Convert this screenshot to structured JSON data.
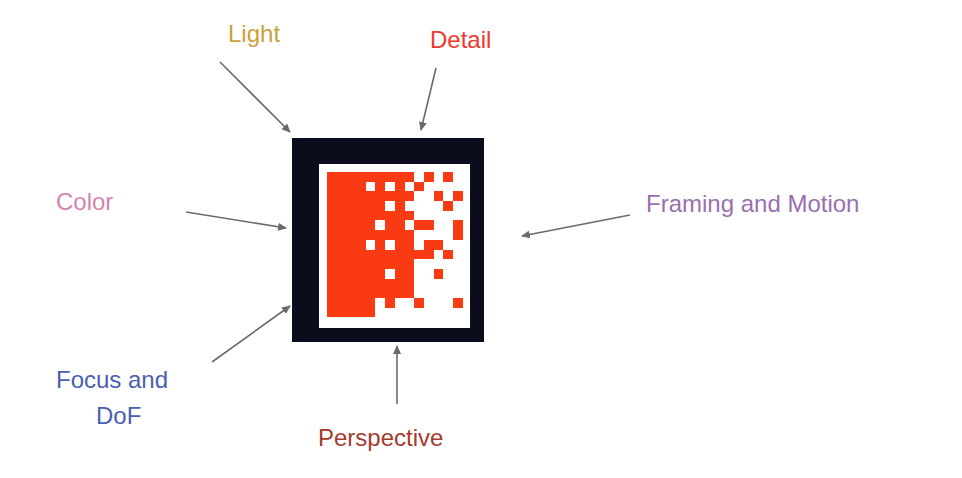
{
  "diagram": {
    "labels": [
      {
        "id": "light",
        "text": "Light",
        "color": "#c9a23a",
        "x": 228,
        "y": 20
      },
      {
        "id": "detail",
        "text": "Detail",
        "color": "#ee3a2e",
        "x": 430,
        "y": 26
      },
      {
        "id": "color",
        "text": "Color",
        "color": "#d584b0",
        "x": 56,
        "y": 188
      },
      {
        "id": "framing",
        "text": "Framing and Motion",
        "color": "#9a6fb0",
        "x": 646,
        "y": 190
      },
      {
        "id": "focus-line1",
        "text": "Focus and",
        "color": "#4a5fb0",
        "x": 56,
        "y": 366
      },
      {
        "id": "focus-line2",
        "text": "DoF",
        "color": "#4a5fb0",
        "x": 96,
        "y": 402
      },
      {
        "id": "perspective",
        "text": "Perspective",
        "color": "#a53a2e",
        "x": 318,
        "y": 424
      }
    ],
    "arrows": [
      {
        "id": "light-arrow",
        "from": [
          220,
          62
        ],
        "to": [
          290,
          132
        ]
      },
      {
        "id": "detail-arrow",
        "from": [
          436,
          68
        ],
        "to": [
          421,
          130
        ]
      },
      {
        "id": "color-arrow",
        "from": [
          186,
          212
        ],
        "to": [
          286,
          228
        ]
      },
      {
        "id": "framing-arrow",
        "from": [
          630,
          215
        ],
        "to": [
          522,
          236
        ]
      },
      {
        "id": "focus-arrow",
        "from": [
          212,
          362
        ],
        "to": [
          290,
          306
        ]
      },
      {
        "id": "perspective-arrow",
        "from": [
          397,
          404
        ],
        "to": [
          397,
          346
        ]
      }
    ],
    "arrow_color": "#6b6b6b",
    "center_icon": {
      "frame_color": "#0b0c1c",
      "fill_color": "#fa3a12",
      "grid_rows": [
        "11111111101010",
        "11110101010000",
        "11111111100101",
        "11111101000010",
        "11111111100000",
        "11111011011001",
        "11111111100001",
        "11110101101100",
        "11111111111010",
        "11111111100000",
        "11111101100100",
        "11111111100000",
        "11111111100000",
        "11111010010001",
        "11111000000000"
      ]
    }
  }
}
